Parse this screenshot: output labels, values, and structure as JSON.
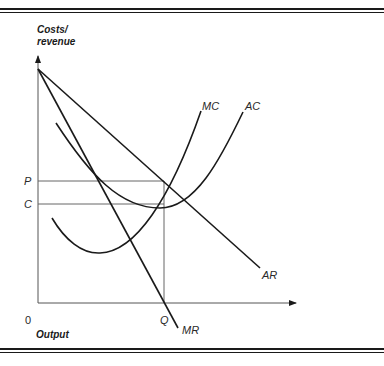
{
  "diagram": {
    "type": "monopoly-profit-maximisation",
    "y_axis_label_line1": "Costs/",
    "y_axis_label_line2": "revenue",
    "x_axis_label": "Output",
    "origin_label": "0",
    "price_label": "P",
    "cost_label": "C",
    "quantity_label": "Q",
    "curves": {
      "mc": {
        "label": "MC"
      },
      "ac": {
        "label": "AC"
      },
      "ar": {
        "label": "AR"
      },
      "mr": {
        "label": "MR"
      }
    },
    "colors": {
      "curve": "#1a1a1a",
      "axis": "#555555",
      "guide": "#666666",
      "border": "#1a1a1a"
    }
  }
}
